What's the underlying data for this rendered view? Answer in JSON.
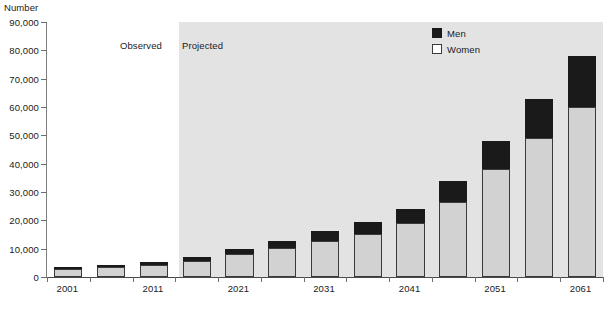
{
  "chart_data": {
    "type": "bar",
    "subtype": "stacked-vertical",
    "title": "",
    "xlabel": "",
    "ylabel": "Number",
    "ylim": [
      0,
      90000
    ],
    "ytick_values": [
      0,
      10000,
      20000,
      30000,
      40000,
      50000,
      60000,
      70000,
      80000,
      90000
    ],
    "ytick_labels": [
      "0",
      "10,000",
      "20,000",
      "30,000",
      "40,000",
      "50,000",
      "60,000",
      "70,000",
      "80,000",
      "90,000"
    ],
    "categories": [
      "2001",
      "2006",
      "2011",
      "2016",
      "2021",
      "2026",
      "2031",
      "2036",
      "2041",
      "2046",
      "2051",
      "2056",
      "2061"
    ],
    "xtick_labels_shown": [
      "2001",
      "2011",
      "2021",
      "2031",
      "2041",
      "2051",
      "2061"
    ],
    "grid": false,
    "legend_position": "top-right",
    "series": [
      {
        "name": "Women",
        "color": "#d2d2d2",
        "values": [
          3000,
          3400,
          4300,
          5800,
          8000,
          10200,
          12800,
          15300,
          19000,
          26500,
          38000,
          49000,
          60000
        ]
      },
      {
        "name": "Men",
        "color": "#1a1a1a",
        "values": [
          600,
          900,
          1000,
          1400,
          2000,
          2500,
          3500,
          4000,
          5000,
          7500,
          10000,
          14000,
          18000
        ]
      }
    ],
    "totals": [
      3600,
      4300,
      5300,
      7200,
      10000,
      12700,
      16300,
      19300,
      24000,
      34000,
      48000,
      63000,
      78000
    ],
    "annotations": [
      {
        "text": "Observed",
        "period_start": "2001",
        "period_end": "2016"
      },
      {
        "text": "Projected",
        "period_start": "2016",
        "period_end": "2061"
      }
    ]
  },
  "axis": {
    "y_title": "Number"
  },
  "annotations": {
    "observed": "Observed",
    "projected": "Projected"
  },
  "legend": {
    "items": [
      {
        "label": "Men",
        "swatch": "filled-black-square"
      },
      {
        "label": "Women",
        "swatch": "open-white-square"
      }
    ]
  },
  "colors": {
    "men": "#1a1a1a",
    "women": "#d2d2d2",
    "projected_band": "#e3e3e3",
    "axis": "#4a4a4a",
    "text": "#1a1a1a"
  }
}
